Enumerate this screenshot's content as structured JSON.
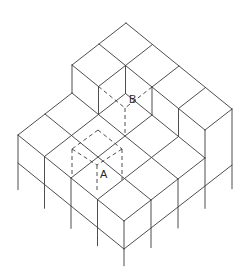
{
  "diagram": {
    "type": "isometric cube assembly",
    "colors": {
      "line": "#3a3a3a",
      "background": "#ffffff"
    },
    "projection": {
      "origin": [
        126,
        51
      ],
      "i_step": [
        26.5,
        21.5
      ],
      "j_step": [
        -27,
        21
      ],
      "h_step": [
        0,
        -28
      ]
    },
    "labels": [
      {
        "text": "B",
        "x": 129,
        "y": 103
      },
      {
        "text": "A",
        "x": 100,
        "y": 178
      }
    ],
    "solid_edges": [
      [
        [
          0,
          0,
          1
        ],
        [
          4,
          0,
          1
        ]
      ],
      [
        [
          0,
          0,
          1
        ],
        [
          0,
          2,
          1
        ]
      ],
      [
        [
          0,
          1,
          1
        ],
        [
          1,
          1,
          1
        ]
      ],
      [
        [
          1,
          0,
          1
        ],
        [
          1,
          2,
          1
        ]
      ],
      [
        [
          2,
          0,
          1
        ],
        [
          2,
          1,
          1
        ]
      ],
      [
        [
          3,
          0,
          1
        ],
        [
          3,
          1,
          1
        ]
      ],
      [
        [
          0,
          2,
          1
        ],
        [
          1,
          2,
          1
        ]
      ],
      [
        [
          1,
          1,
          1
        ],
        [
          4,
          1,
          1
        ]
      ],
      [
        [
          4,
          0,
          1
        ],
        [
          4,
          1,
          1
        ]
      ],
      [
        [
          0,
          2,
          1
        ],
        [
          0,
          2,
          0
        ]
      ],
      [
        [
          1,
          2,
          1
        ],
        [
          1,
          2,
          0
        ]
      ],
      [
        [
          1,
          1,
          1
        ],
        [
          1,
          1,
          0
        ]
      ],
      [
        [
          2,
          1,
          1
        ],
        [
          2,
          1,
          0
        ]
      ],
      [
        [
          3,
          1,
          1
        ],
        [
          3,
          1,
          0
        ]
      ],
      [
        [
          4,
          1,
          1
        ],
        [
          4,
          1,
          0
        ]
      ],
      [
        [
          0,
          2,
          0
        ],
        [
          0,
          4,
          0
        ]
      ],
      [
        [
          1,
          1,
          0
        ],
        [
          1,
          4,
          0
        ]
      ],
      [
        [
          2,
          1,
          0
        ],
        [
          2,
          4,
          0
        ]
      ],
      [
        [
          3,
          1,
          0
        ],
        [
          3,
          4,
          0
        ]
      ],
      [
        [
          4,
          1,
          0
        ],
        [
          4,
          4,
          0
        ]
      ],
      [
        [
          1,
          1,
          0
        ],
        [
          4,
          1,
          0
        ]
      ],
      [
        [
          0,
          2,
          0
        ],
        [
          4,
          2,
          0
        ]
      ],
      [
        [
          0,
          3,
          0
        ],
        [
          4,
          3,
          0
        ]
      ],
      [
        [
          0,
          4,
          0
        ],
        [
          4,
          4,
          0
        ]
      ],
      [
        [
          0,
          4,
          -1
        ],
        [
          4,
          4,
          -1
        ]
      ],
      [
        [
          4,
          0,
          -1
        ],
        [
          4,
          4,
          -1
        ]
      ],
      [
        [
          4,
          0,
          1
        ],
        [
          4,
          0,
          -1.85
        ]
      ],
      [
        [
          4,
          1,
          0
        ],
        [
          4,
          1,
          -1.8
        ]
      ],
      [
        [
          4,
          2,
          0
        ],
        [
          4,
          2,
          -1.75
        ]
      ],
      [
        [
          4,
          3,
          0
        ],
        [
          4,
          3,
          -1.7
        ]
      ],
      [
        [
          4,
          4,
          0
        ],
        [
          4,
          4,
          -1.6
        ]
      ],
      [
        [
          0,
          4,
          0
        ],
        [
          0,
          4,
          -1.95
        ]
      ],
      [
        [
          1,
          4,
          0
        ],
        [
          1,
          4,
          -1.85
        ]
      ],
      [
        [
          2,
          4,
          0
        ],
        [
          2,
          4,
          -1.8
        ]
      ],
      [
        [
          3,
          4,
          0
        ],
        [
          3,
          4,
          -1.65
        ]
      ]
    ],
    "hidden_cube_B": [
      [
        [
          1,
          2,
          1
        ],
        [
          2,
          2,
          1
        ]
      ],
      [
        [
          2,
          1,
          1
        ],
        [
          2,
          2,
          1
        ]
      ],
      [
        [
          2,
          2,
          1
        ],
        [
          2,
          2,
          0
        ]
      ]
    ],
    "hidden_cube_A_screen": [
      [
        [
          98,
          130
        ],
        [
          72,
          149
        ]
      ],
      [
        [
          98,
          130
        ],
        [
          122,
          149
        ]
      ],
      [
        [
          72,
          149
        ],
        [
          97,
          165
        ]
      ],
      [
        [
          122,
          149
        ],
        [
          97,
          165
        ]
      ],
      [
        [
          72,
          149
        ],
        [
          72,
          176
        ]
      ],
      [
        [
          122,
          149
        ],
        [
          122,
          180
        ]
      ],
      [
        [
          97,
          165
        ],
        [
          97,
          191
        ]
      ]
    ]
  }
}
